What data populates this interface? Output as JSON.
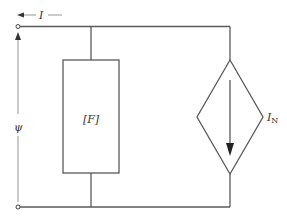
{
  "diagram": {
    "type": "circuit-schematic",
    "title": "",
    "labels": {
      "current": "I",
      "voltage": "ψ",
      "element": "[F]",
      "source_main": "I",
      "source_sub": "N"
    },
    "colors": {
      "wire": "#5a5a5a",
      "label": "#333333",
      "background": "#ffffff"
    },
    "components": [
      {
        "id": "terminal-top",
        "kind": "terminal",
        "x": 18,
        "y": 26
      },
      {
        "id": "terminal-bottom",
        "kind": "terminal",
        "x": 18,
        "y": 207
      },
      {
        "id": "element-F",
        "kind": "impedance-box",
        "label": "[F]"
      },
      {
        "id": "source-IN",
        "kind": "dependent-current-source",
        "label": "I_N",
        "direction": "down"
      }
    ]
  }
}
